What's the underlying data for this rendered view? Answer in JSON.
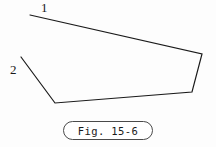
{
  "figure": {
    "caption": "Fig. 15-6",
    "background_color": "#fdfdfd",
    "stroke_color": "#1a1a1a",
    "stroke_width": 1.2,
    "labels": [
      {
        "text": "1",
        "x": 44,
        "y": 8,
        "describes": "upper-left free endpoint of polyline"
      },
      {
        "text": "2",
        "x": 14,
        "y": 70,
        "describes": "left free endpoint of polyline"
      }
    ],
    "polyline": {
      "closed": false,
      "points": "30,15 202,54 192,92 55,103 21,57",
      "vertices": [
        {
          "name": "endpoint-1",
          "x": 30,
          "y": 15
        },
        {
          "name": "corner-right-upper",
          "x": 202,
          "y": 54
        },
        {
          "name": "corner-right-lower",
          "x": 192,
          "y": 92
        },
        {
          "name": "corner-bottom-left",
          "x": 55,
          "y": 103
        },
        {
          "name": "endpoint-2",
          "x": 21,
          "y": 57
        }
      ]
    }
  }
}
